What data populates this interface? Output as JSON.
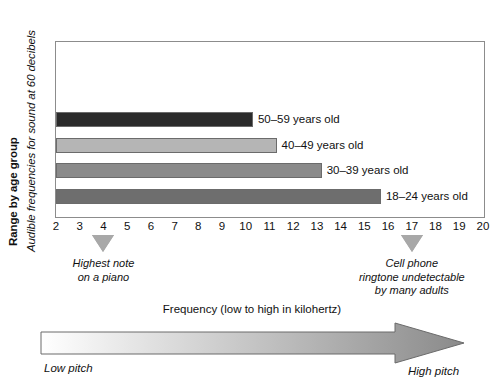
{
  "chart_data": {
    "type": "bar",
    "orientation": "horizontal",
    "title": "",
    "xlabel": "Frequency (low to high in kilohertz)",
    "ylabel": "Range by age group",
    "ylabel_secondary": "Audible frequencies for sound at 60 decibels",
    "xlim": [
      2,
      20
    ],
    "xticks": [
      2,
      3,
      4,
      5,
      6,
      7,
      8,
      9,
      10,
      11,
      12,
      13,
      14,
      15,
      16,
      17,
      18,
      19,
      20
    ],
    "grid": false,
    "legend": "none",
    "categories": [
      "50–59 years old",
      "40–49 years old",
      "30–39 years old",
      "18–24 years old"
    ],
    "values": [
      10.3,
      11.3,
      13.2,
      15.7
    ],
    "bars": [
      {
        "label": "50–59 years old",
        "value": 10.3,
        "color": "#2b2b2b"
      },
      {
        "label": "40–49 years old",
        "value": 11.3,
        "color": "#b5b5b5"
      },
      {
        "label": "30–39 years old",
        "value": 13.2,
        "color": "#8a8a8a"
      },
      {
        "label": "18–24 years old",
        "value": 15.7,
        "color": "#6e6e6e"
      }
    ],
    "annotations": [
      {
        "at": 4,
        "text_line1": "Highest note",
        "text_line2": "on a piano",
        "text_line3": "",
        "marker": "triangle-down"
      },
      {
        "at": 17,
        "text_line1": "Cell phone",
        "text_line2": "ringtone undetectable",
        "text_line3": "by many adults",
        "marker": "triangle-down"
      }
    ],
    "pitch_scale": {
      "title": "Frequency (low to high in kilohertz)",
      "low_label": "Low pitch",
      "high_label": "High pitch",
      "gradient_from": "#ffffff",
      "gradient_to": "#8a8a8a"
    }
  },
  "colors": {
    "frame": "#8c8c8c",
    "bar_outline": "#6b6b6b",
    "marker": "#a8a8a8",
    "text": "#111111"
  }
}
